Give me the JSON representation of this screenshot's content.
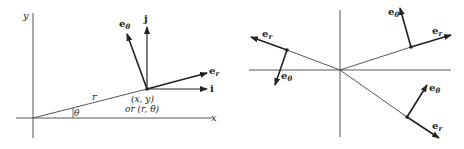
{
  "figure": {
    "left": {
      "axis_labels": {
        "x": "x",
        "y": "y"
      },
      "radius_label": "r",
      "angle_label": "θ",
      "point_label_line1": "(x, y)",
      "point_label_line2": "or (r, θ)",
      "vectors": [
        {
          "name": "e",
          "subscript": "θ"
        },
        {
          "name": "j",
          "subscript": ""
        },
        {
          "name": "e",
          "subscript": "r"
        },
        {
          "name": "i",
          "subscript": ""
        }
      ]
    },
    "right": {
      "points": [
        {
          "position": "upper-left",
          "er": {
            "name": "e",
            "subscript": "r"
          },
          "etheta": {
            "name": "e",
            "subscript": "θ"
          }
        },
        {
          "position": "upper-right",
          "er": {
            "name": "e",
            "subscript": "r"
          },
          "etheta": {
            "name": "e",
            "subscript": "θ"
          }
        },
        {
          "position": "lower-right",
          "er": {
            "name": "e",
            "subscript": "r"
          },
          "etheta": {
            "name": "e",
            "subscript": "θ"
          }
        }
      ]
    },
    "colors": {
      "ink": "#222222",
      "background": "#ffffff"
    }
  }
}
